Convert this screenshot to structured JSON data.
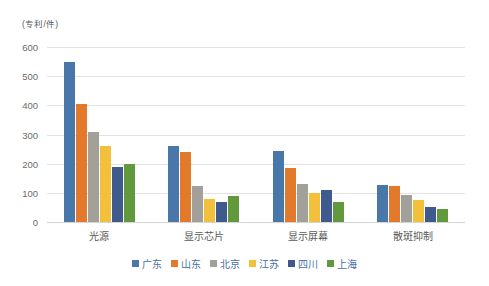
{
  "chart_data": {
    "type": "bar",
    "title": "",
    "subtitle": "",
    "xlabel": "",
    "ylabel": "(专利/件)",
    "unit_caption": "(专利/件)",
    "categories": [
      "光源",
      "显示芯片",
      "显示屏幕",
      "散斑抑制"
    ],
    "series": [
      {
        "name": "广东",
        "color": "#4a77aa",
        "values": [
          550,
          262,
          242,
          128
        ]
      },
      {
        "name": "山东",
        "color": "#e2792b",
        "values": [
          405,
          240,
          185,
          122
        ]
      },
      {
        "name": "北京",
        "color": "#a3a09a",
        "values": [
          310,
          123,
          130,
          93
        ]
      },
      {
        "name": "江苏",
        "color": "#f3c03b",
        "values": [
          260,
          78,
          98,
          75
        ]
      },
      {
        "name": "四川",
        "color": "#3f5b8e",
        "values": [
          190,
          70,
          110,
          50
        ]
      },
      {
        "name": "上海",
        "color": "#63993d",
        "values": [
          200,
          88,
          70,
          45
        ]
      }
    ],
    "ylim": [
      0,
      600
    ],
    "yticks": [
      0,
      100,
      200,
      300,
      400,
      500,
      600
    ],
    "ytick_labels": [
      "0",
      "100",
      "200",
      "300",
      "400",
      "500",
      "600"
    ],
    "grid": true,
    "grid_axis": "y",
    "legend_position": "bottom",
    "background_color": "#ffffff",
    "grid_color": "#e2e2e2",
    "axis_text_color": "#6b6b6b",
    "legend_text_color": "#4a6fa0"
  }
}
